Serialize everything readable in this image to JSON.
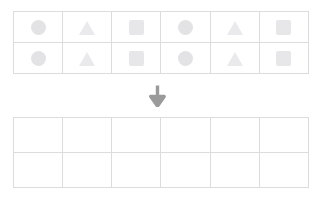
{
  "worksheet": {
    "title": "Shape pattern sorting worksheet",
    "colors": {
      "grid_border": "#dcdcdf",
      "circle": "#e3e3e5",
      "triangle": "#eaeaec",
      "square": "#e7e7e9",
      "arrow": "#9a9a9a",
      "background": "#ffffff"
    },
    "source_table": {
      "name": "source-shape-grid",
      "columns": 6,
      "rows": [
        {
          "name": "source-row-1",
          "cells": [
            {
              "shape": "circle",
              "label": "circle"
            },
            {
              "shape": "triangle",
              "label": "triangle"
            },
            {
              "shape": "square",
              "label": "square"
            },
            {
              "shape": "circle",
              "label": "circle"
            },
            {
              "shape": "triangle",
              "label": "triangle"
            },
            {
              "shape": "square",
              "label": "square"
            }
          ]
        },
        {
          "name": "source-row-2",
          "cells": [
            {
              "shape": "circle",
              "label": "circle"
            },
            {
              "shape": "triangle",
              "label": "triangle"
            },
            {
              "shape": "square",
              "label": "square"
            },
            {
              "shape": "circle",
              "label": "circle"
            },
            {
              "shape": "triangle",
              "label": "triangle"
            },
            {
              "shape": "square",
              "label": "square"
            }
          ]
        }
      ]
    },
    "arrow": {
      "name": "down-arrow-icon",
      "direction": "down",
      "glyph": "arrow-down"
    },
    "target_table": {
      "name": "target-empty-grid",
      "columns": 6,
      "rows": [
        {
          "name": "target-row-1",
          "cells": [
            {
              "shape": "empty",
              "label": ""
            },
            {
              "shape": "empty",
              "label": ""
            },
            {
              "shape": "empty",
              "label": ""
            },
            {
              "shape": "empty",
              "label": ""
            },
            {
              "shape": "empty",
              "label": ""
            },
            {
              "shape": "empty",
              "label": ""
            }
          ]
        },
        {
          "name": "target-row-2",
          "cells": [
            {
              "shape": "empty",
              "label": ""
            },
            {
              "shape": "empty",
              "label": ""
            },
            {
              "shape": "empty",
              "label": ""
            },
            {
              "shape": "empty",
              "label": ""
            },
            {
              "shape": "empty",
              "label": ""
            },
            {
              "shape": "empty",
              "label": ""
            }
          ]
        }
      ]
    }
  }
}
